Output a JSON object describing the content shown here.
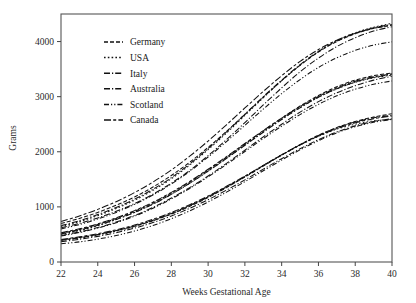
{
  "chart_data": {
    "type": "line",
    "title": "",
    "xlabel": "Weeks Gestational Age",
    "ylabel": "Grams",
    "xlim": [
      22,
      40
    ],
    "ylim": [
      0,
      4500
    ],
    "xticks": [
      22,
      24,
      26,
      28,
      30,
      32,
      34,
      36,
      38,
      40
    ],
    "yticks": [
      0,
      1000,
      2000,
      3000,
      4000
    ],
    "grid": false,
    "legend_position": "upper-left-inside",
    "x": [
      22,
      23,
      24,
      25,
      26,
      27,
      28,
      29,
      30,
      31,
      32,
      33,
      34,
      35,
      36,
      37,
      38,
      39,
      40
    ],
    "bands": [
      "90th percentile",
      "50th percentile",
      "10th percentile"
    ],
    "series": [
      {
        "name": "Germany",
        "dash": "4,2",
        "bands": {
          "90th percentile": [
            700,
            790,
            900,
            1030,
            1180,
            1360,
            1570,
            1810,
            2080,
            2370,
            2680,
            2990,
            3290,
            3570,
            3810,
            4000,
            4140,
            4240,
            4300
          ],
          "50th percentile": [
            520,
            590,
            680,
            790,
            920,
            1070,
            1250,
            1450,
            1670,
            1900,
            2140,
            2380,
            2610,
            2830,
            3020,
            3180,
            3300,
            3380,
            3430
          ],
          "10th percentile": [
            400,
            445,
            500,
            570,
            650,
            750,
            870,
            1010,
            1170,
            1350,
            1540,
            1740,
            1940,
            2130,
            2300,
            2440,
            2550,
            2630,
            2690
          ]
        }
      },
      {
        "name": "USA",
        "dash": "1.6,2.2",
        "bands": {
          "90th percentile": [
            640,
            730,
            840,
            970,
            1120,
            1300,
            1510,
            1760,
            2040,
            2340,
            2660,
            2980,
            3290,
            3570,
            3820,
            4020,
            4160,
            4260,
            4330
          ],
          "50th percentile": [
            500,
            570,
            660,
            770,
            900,
            1050,
            1230,
            1430,
            1650,
            1880,
            2120,
            2360,
            2590,
            2800,
            2990,
            3140,
            3260,
            3340,
            3390
          ],
          "10th percentile": [
            390,
            435,
            490,
            560,
            645,
            750,
            875,
            1020,
            1180,
            1360,
            1550,
            1750,
            1940,
            2120,
            2280,
            2410,
            2500,
            2560,
            2590
          ]
        }
      },
      {
        "name": "Italy",
        "dash": "6,2,1.2,2",
        "bands": {
          "90th percentile": [
            620,
            700,
            800,
            920,
            1060,
            1230,
            1430,
            1660,
            1930,
            2220,
            2530,
            2850,
            3160,
            3450,
            3700,
            3910,
            4070,
            4190,
            4270
          ],
          "50th percentile": [
            480,
            545,
            625,
            725,
            845,
            990,
            1160,
            1350,
            1560,
            1790,
            2030,
            2270,
            2500,
            2720,
            2910,
            3070,
            3200,
            3300,
            3370
          ],
          "10th percentile": [
            370,
            412,
            465,
            532,
            615,
            715,
            835,
            975,
            1130,
            1305,
            1490,
            1685,
            1875,
            2055,
            2220,
            2360,
            2470,
            2550,
            2600
          ]
        }
      },
      {
        "name": "Australia",
        "dash": "6,2,1.2,2",
        "bands": {
          "90th percentile": [
            660,
            750,
            860,
            990,
            1140,
            1320,
            1530,
            1780,
            2060,
            2360,
            2680,
            3000,
            3300,
            3580,
            3820,
            4010,
            4150,
            4250,
            4310
          ],
          "50th percentile": [
            510,
            578,
            665,
            772,
            900,
            1050,
            1228,
            1428,
            1648,
            1880,
            2118,
            2355,
            2585,
            2800,
            2990,
            3145,
            3265,
            3350,
            3405
          ],
          "10th percentile": [
            395,
            440,
            497,
            568,
            653,
            757,
            882,
            1025,
            1185,
            1363,
            1552,
            1750,
            1945,
            2130,
            2295,
            2435,
            2540,
            2615,
            2660
          ]
        }
      },
      {
        "name": "Scotland",
        "dash": "5,2,1.2,2,1.2,2",
        "bands": {
          "90th percentile": [
            600,
            680,
            780,
            900,
            1045,
            1215,
            1415,
            1645,
            1905,
            2185,
            2480,
            2775,
            3055,
            3310,
            3530,
            3705,
            3840,
            3935,
            3995
          ],
          "50th percentile": [
            470,
            535,
            615,
            713,
            832,
            975,
            1145,
            1335,
            1545,
            1770,
            2005,
            2240,
            2465,
            2675,
            2860,
            3015,
            3135,
            3225,
            3285
          ],
          "10th percentile": [
            330,
            365,
            415,
            480,
            562,
            663,
            785,
            928,
            1090,
            1268,
            1458,
            1655,
            1850,
            2035,
            2200,
            2345,
            2455,
            2535,
            2585
          ]
        }
      },
      {
        "name": "Canada",
        "dash": "7,2.2,3,2.2",
        "bands": {
          "90th percentile": [
            735,
            835,
            955,
            1095,
            1260,
            1450,
            1670,
            1920,
            2195,
            2490,
            2795,
            3095,
            3380,
            3640,
            3855,
            4025,
            4150,
            4240,
            4295
          ],
          "50th percentile": [
            530,
            602,
            692,
            802,
            932,
            1085,
            1263,
            1463,
            1683,
            1913,
            2150,
            2385,
            2610,
            2820,
            3005,
            3160,
            3280,
            3360,
            3415
          ],
          "10th percentile": [
            410,
            456,
            513,
            585,
            670,
            775,
            898,
            1040,
            1198,
            1373,
            1558,
            1753,
            1943,
            2123,
            2285,
            2420,
            2525,
            2600,
            2650
          ]
        }
      }
    ]
  },
  "legend": {
    "items": [
      {
        "label": "Germany"
      },
      {
        "label": "USA"
      },
      {
        "label": "Italy"
      },
      {
        "label": "Australia"
      },
      {
        "label": "Scotland"
      },
      {
        "label": "Canada"
      }
    ]
  },
  "axes": {
    "y_title": "Grams",
    "x_title": "Weeks Gestational Age",
    "x_tick_labels": [
      "22",
      "24",
      "26",
      "28",
      "30",
      "32",
      "34",
      "36",
      "38",
      "40"
    ],
    "y_tick_labels": [
      "0",
      "1000",
      "2000",
      "3000",
      "4000"
    ]
  },
  "colors": {
    "line": "#111111",
    "frame": "#555555",
    "text": "#1a1a1a"
  }
}
